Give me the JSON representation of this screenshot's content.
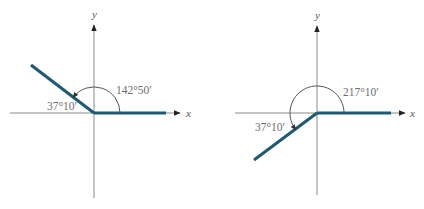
{
  "figures": [
    {
      "id": "left",
      "angle_label": "142°50′",
      "reference_label": "37°10′",
      "x_label": "x",
      "y_label": "y"
    },
    {
      "id": "right",
      "angle_label": "217°10′",
      "reference_label": "37°10′",
      "x_label": "x",
      "y_label": "y"
    }
  ],
  "colors": {
    "terminal_ray": "#1f5a72",
    "axes": "#8a8a8a",
    "labels": "#6e6e6e"
  }
}
